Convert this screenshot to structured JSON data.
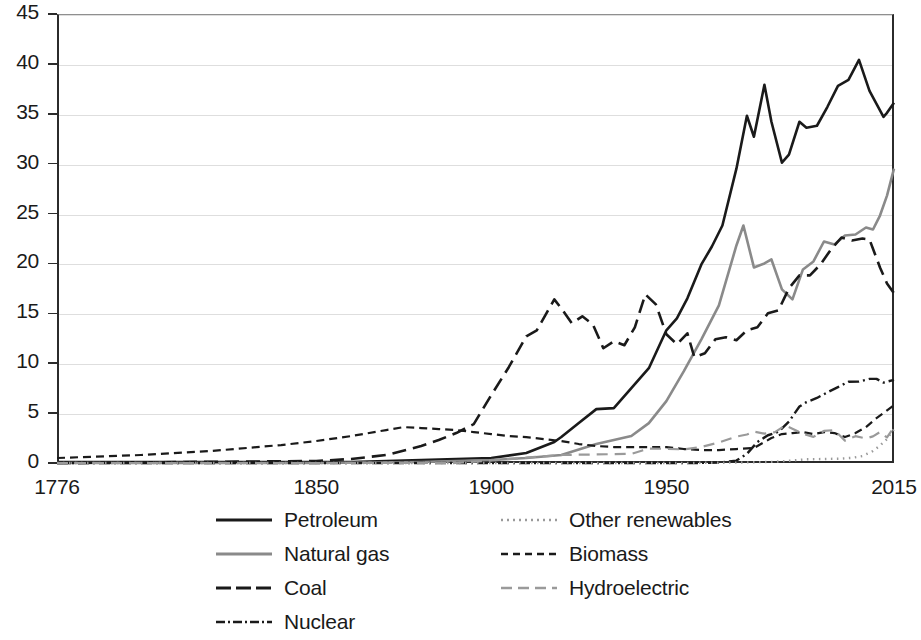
{
  "chart_data": {
    "type": "line",
    "title": "",
    "xlabel": "",
    "ylabel": "",
    "xlim": [
      1776,
      2015
    ],
    "ylim": [
      0,
      45
    ],
    "grid": true,
    "legend_position": "bottom",
    "x_ticks": [
      "1776",
      "1850",
      "1900",
      "1950",
      "2015"
    ],
    "x_tick_values": [
      1776,
      1850,
      1900,
      1950,
      2015
    ],
    "y_ticks": [
      "0",
      "5",
      "10",
      "15",
      "20",
      "25",
      "30",
      "35",
      "40",
      "45"
    ],
    "y_tick_values": [
      0,
      5,
      10,
      15,
      20,
      25,
      30,
      35,
      40,
      45
    ],
    "series": [
      {
        "name": "Petroleum",
        "color": "#1a1a1a",
        "style": "solid",
        "x": [
          1776,
          1850,
          1860,
          1870,
          1880,
          1890,
          1900,
          1910,
          1918,
          1920,
          1925,
          1930,
          1935,
          1940,
          1945,
          1950,
          1953,
          1956,
          1960,
          1963,
          1966,
          1970,
          1973,
          1975,
          1978,
          1980,
          1983,
          1985,
          1988,
          1990,
          1993,
          1996,
          1999,
          2002,
          2005,
          2008,
          2010,
          2012,
          2013,
          2015
        ],
        "values": [
          0.1,
          0.1,
          0.1,
          0.2,
          0.3,
          0.4,
          0.5,
          1.0,
          2.1,
          2.6,
          4.0,
          5.4,
          5.5,
          7.5,
          9.5,
          13.3,
          14.5,
          16.5,
          19.9,
          21.7,
          23.8,
          29.5,
          34.8,
          32.7,
          37.9,
          34.2,
          30.1,
          30.9,
          34.2,
          33.6,
          33.8,
          35.7,
          37.8,
          38.4,
          40.4,
          37.3,
          36.0,
          34.7,
          35.1,
          36.1
        ]
      },
      {
        "name": "Natural gas",
        "color": "#8a8a8a",
        "style": "solid",
        "x": [
          1776,
          1850,
          1880,
          1890,
          1900,
          1910,
          1920,
          1930,
          1940,
          1945,
          1950,
          1955,
          1960,
          1965,
          1970,
          1972,
          1975,
          1978,
          1980,
          1983,
          1986,
          1989,
          1992,
          1995,
          1998,
          2001,
          2004,
          2007,
          2009,
          2011,
          2013,
          2015
        ],
        "values": [
          0.0,
          0.0,
          0.1,
          0.2,
          0.3,
          0.5,
          0.8,
          1.9,
          2.7,
          4.0,
          6.2,
          9.2,
          12.4,
          15.8,
          21.8,
          23.8,
          19.6,
          20.0,
          20.4,
          17.4,
          16.4,
          19.4,
          20.2,
          22.2,
          21.9,
          22.8,
          22.9,
          23.6,
          23.4,
          24.8,
          26.8,
          29.5
        ]
      },
      {
        "name": "Coal",
        "color": "#1a1a1a",
        "style": "dashed-long",
        "x": [
          1776,
          1850,
          1860,
          1870,
          1880,
          1885,
          1890,
          1895,
          1900,
          1905,
          1910,
          1913,
          1918,
          1920,
          1923,
          1926,
          1929,
          1932,
          1935,
          1938,
          1941,
          1944,
          1947,
          1950,
          1953,
          1956,
          1958,
          1961,
          1964,
          1967,
          1970,
          1973,
          1976,
          1979,
          1982,
          1985,
          1988,
          1991,
          1994,
          1997,
          2000,
          2003,
          2006,
          2008,
          2011,
          2013,
          2015
        ],
        "values": [
          0.0,
          0.2,
          0.4,
          0.8,
          1.7,
          2.3,
          3.0,
          3.9,
          6.8,
          9.6,
          12.7,
          13.3,
          16.4,
          15.5,
          14.0,
          14.7,
          13.9,
          11.5,
          12.2,
          11.8,
          13.6,
          16.9,
          15.9,
          12.9,
          11.9,
          13.0,
          10.6,
          11.0,
          12.4,
          12.6,
          12.3,
          13.3,
          13.6,
          15.0,
          15.3,
          17.5,
          18.8,
          18.8,
          19.9,
          21.4,
          22.6,
          22.3,
          22.5,
          22.4,
          19.6,
          18.0,
          17.0
        ]
      },
      {
        "name": "Nuclear",
        "color": "#1a1a1a",
        "style": "dash-dot",
        "x": [
          1776,
          1900,
          1950,
          1957,
          1960,
          1965,
          1970,
          1973,
          1976,
          1979,
          1982,
          1985,
          1988,
          1990,
          1993,
          1996,
          1999,
          2002,
          2005,
          2008,
          2010,
          2012,
          2015
        ],
        "values": [
          0.0,
          0.0,
          0.0,
          0.0,
          0.01,
          0.04,
          0.24,
          0.91,
          2.11,
          2.78,
          3.13,
          4.15,
          5.66,
          6.1,
          6.52,
          7.08,
          7.61,
          8.14,
          8.16,
          8.43,
          8.43,
          8.06,
          8.34
        ]
      },
      {
        "name": "Other renewables",
        "color": "#9a9a9a",
        "style": "dotted",
        "x": [
          1776,
          1900,
          1950,
          1960,
          1970,
          1980,
          1985,
          1990,
          1995,
          2000,
          2003,
          2006,
          2009,
          2011,
          2013,
          2015
        ],
        "values": [
          0.0,
          0.0,
          0.0,
          0.02,
          0.04,
          0.11,
          0.22,
          0.37,
          0.4,
          0.44,
          0.52,
          0.7,
          1.2,
          1.75,
          2.4,
          3.4
        ]
      },
      {
        "name": "Biomass",
        "color": "#1a1a1a",
        "style": "dashed-short",
        "x": [
          1776,
          1800,
          1820,
          1840,
          1850,
          1860,
          1870,
          1875,
          1880,
          1885,
          1890,
          1895,
          1900,
          1905,
          1910,
          1915,
          1920,
          1925,
          1930,
          1935,
          1940,
          1945,
          1950,
          1955,
          1960,
          1965,
          1970,
          1975,
          1980,
          1983,
          1986,
          1989,
          1992,
          1995,
          1998,
          2001,
          2004,
          2007,
          2010,
          2012,
          2015
        ],
        "values": [
          0.5,
          0.8,
          1.2,
          1.8,
          2.2,
          2.7,
          3.3,
          3.6,
          3.5,
          3.4,
          3.3,
          3.1,
          2.9,
          2.7,
          2.6,
          2.4,
          2.2,
          1.9,
          1.7,
          1.6,
          1.6,
          1.6,
          1.6,
          1.4,
          1.3,
          1.3,
          1.4,
          1.5,
          2.5,
          2.9,
          3.0,
          3.1,
          2.9,
          3.1,
          3.0,
          2.6,
          3.0,
          3.6,
          4.5,
          5.0,
          5.8
        ]
      },
      {
        "name": "Hydroelectric",
        "color": "#9a9a9a",
        "style": "dashed-gray",
        "x": [
          1776,
          1880,
          1890,
          1900,
          1910,
          1920,
          1930,
          1940,
          1945,
          1950,
          1955,
          1960,
          1965,
          1970,
          1973,
          1975,
          1978,
          1981,
          1984,
          1986,
          1989,
          1992,
          1995,
          1998,
          2001,
          2004,
          2007,
          2009,
          2011,
          2013,
          2015
        ],
        "values": [
          0.0,
          0.0,
          0.01,
          0.25,
          0.54,
          0.8,
          0.86,
          0.92,
          1.44,
          1.42,
          1.36,
          1.61,
          2.06,
          2.65,
          2.86,
          3.15,
          2.94,
          3.09,
          3.77,
          3.43,
          2.94,
          2.62,
          3.21,
          3.3,
          2.24,
          2.69,
          2.46,
          2.67,
          3.1,
          2.56,
          3.6
        ]
      }
    ]
  },
  "legend": {
    "left_items": [
      {
        "label": "Petroleum",
        "swatch": "solid-black"
      },
      {
        "label": "Natural gas",
        "swatch": "solid-gray"
      },
      {
        "label": "Coal",
        "swatch": "dashed-long-black"
      },
      {
        "label": "Nuclear",
        "swatch": "dash-dot-black"
      }
    ],
    "right_items": [
      {
        "label": "Other renewables",
        "swatch": "dotted-gray"
      },
      {
        "label": "Biomass",
        "swatch": "dashed-short-black"
      },
      {
        "label": "Hydroelectric",
        "swatch": "dashed-gray"
      }
    ]
  }
}
